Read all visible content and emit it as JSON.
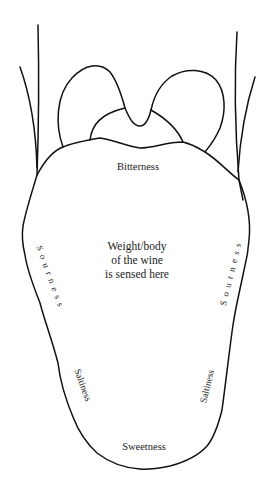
{
  "diagram": {
    "labels": {
      "bitterness": "Bitterness",
      "center_line1": "Weight/body",
      "center_line2": "of the wine",
      "center_line3": "is sensed here",
      "sourness_left": "Sourness",
      "sourness_right": "Sourness",
      "saltiness_left": "Saltiness",
      "saltiness_right": "Saltiness",
      "sweetness": "Sweetness"
    },
    "colors": {
      "line": "#111111",
      "text": "#222222",
      "background": "#ffffff"
    }
  }
}
